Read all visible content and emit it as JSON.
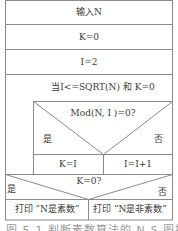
{
  "diagram": {
    "type": "Nassi-Shneiderman structured flowchart",
    "steps": {
      "input": "输入N",
      "init_k": "K=0",
      "init_i": "I=2",
      "loop_condition": "当I<=SQRT(N) 和 K=0",
      "inner_decision": {
        "condition": "Mod(N, I )=0?",
        "yes_label": "是",
        "no_label": "否",
        "yes_action": "K=I",
        "no_action": "I=I+1"
      },
      "final_decision": {
        "condition": "K=0?",
        "yes_label": "是",
        "no_label": "否",
        "yes_action": "打印 “N是素数”",
        "no_action": "打印 “N是非素数”"
      }
    },
    "caption": "图 5-1   判断素数算法的 N-S 图描述"
  },
  "colors": {
    "line": "#8a8a8a",
    "text": "#3a3a3a",
    "background": "#ffffff"
  }
}
